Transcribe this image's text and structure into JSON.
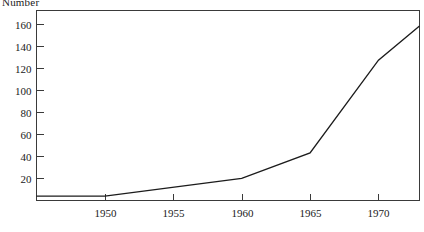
{
  "chart_data": {
    "type": "line",
    "title": "",
    "ylabel": "Number",
    "xlabel": "",
    "x": [
      1945,
      1950,
      1960,
      1965,
      1970,
      1973
    ],
    "values": [
      4,
      4,
      20,
      43,
      127,
      158
    ],
    "series": [
      {
        "name": "Number",
        "x": [
          1945,
          1950,
          1960,
          1965,
          1970,
          1973
        ],
        "values": [
          4,
          4,
          20,
          43,
          127,
          158
        ]
      }
    ],
    "xlim": [
      1945,
      1973
    ],
    "ylim": [
      0,
      172
    ],
    "xticks": [
      1950,
      1955,
      1960,
      1965,
      1970
    ],
    "xtick_labels": [
      "1950",
      "1955",
      "1960",
      "1965",
      "1970"
    ],
    "yticks": [
      20,
      40,
      60,
      80,
      100,
      120,
      140,
      160
    ],
    "ytick_labels": [
      "20",
      "40",
      "60",
      "80",
      "100",
      "120",
      "140",
      "160"
    ],
    "grid": false,
    "legend": false,
    "legend_position": "none",
    "line_color": "#1c1c1c",
    "frame_color": "#3a3a3a",
    "background_color": "#ffffff"
  }
}
